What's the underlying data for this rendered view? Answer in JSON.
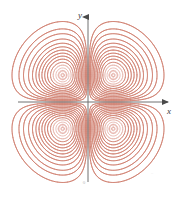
{
  "figure": {
    "title": "",
    "background_color": "#ffffff",
    "width": 186,
    "height": 197
  },
  "axes": {
    "x_label": "x",
    "y_label": "y",
    "origin_label": "0",
    "axis_color": "#707070",
    "x_axis": {
      "start_px": 18,
      "end_px": 172,
      "y_px": 102
    },
    "y_axis": {
      "start_px": 182,
      "end_px": 12,
      "x_px": 88
    },
    "arrowheads": [
      "x-positive",
      "y-positive"
    ]
  },
  "corner_mark": {
    "text": "··"
  },
  "chart_data": {
    "type": "contour",
    "title": "",
    "subtitle": "",
    "xlabel": "x",
    "ylabel": "y",
    "xlim": [
      -2.6,
      2.6
    ],
    "ylim": [
      -2.6,
      2.6
    ],
    "grid": false,
    "legend": false,
    "legend_position": "none",
    "function": "f(x,y) = x*y*exp(-(x^2+y^2))",
    "line_color": "#c9705e",
    "line_color_light": "#e0a499",
    "line_width": 0.6,
    "n_levels": 17,
    "levels": [
      0.01,
      0.02,
      0.03,
      0.045,
      0.06,
      0.075,
      0.09,
      0.105,
      0.12,
      0.135,
      0.15,
      0.162,
      0.172,
      0.18,
      0.1785,
      0.183,
      0.1835
    ],
    "extrema": [
      {
        "label": "max",
        "x": 0.707,
        "y": 0.707,
        "value": 0.1839,
        "px": [
          119,
          68
        ]
      },
      {
        "label": "max",
        "x": -0.707,
        "y": -0.707,
        "value": 0.1839,
        "px": [
          57,
          136
        ]
      },
      {
        "label": "min",
        "x": -0.707,
        "y": 0.707,
        "value": -0.1839,
        "px": [
          57,
          68
        ]
      },
      {
        "label": "min",
        "x": 0.707,
        "y": -0.707,
        "value": -0.1839,
        "px": [
          119,
          136
        ]
      },
      {
        "label": "saddle",
        "x": 0,
        "y": 0,
        "value": 0,
        "px": [
          88,
          102
        ]
      }
    ],
    "lobe_centers_px": [
      [
        57,
        68
      ],
      [
        119,
        68
      ],
      [
        57,
        136
      ],
      [
        119,
        136
      ]
    ],
    "lobes": 4
  }
}
